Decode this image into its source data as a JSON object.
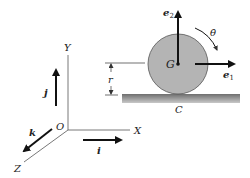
{
  "diagram": {
    "title": "",
    "labels": {
      "e2": "e",
      "e2_sub": "2",
      "e1": "e",
      "e1_sub": "1",
      "theta_dot": "θ̇",
      "G": "G",
      "C": "C",
      "r": "r",
      "Y": "Y",
      "X": "X",
      "Z": "Z",
      "O": "O",
      "i": "i",
      "j": "j",
      "k": "k"
    },
    "colors": {
      "disk_fill": "#b4b4b4",
      "disk_stroke": "#555555",
      "ground": "#8a8a8a",
      "line": "#222222",
      "axis": "#555555"
    }
  }
}
